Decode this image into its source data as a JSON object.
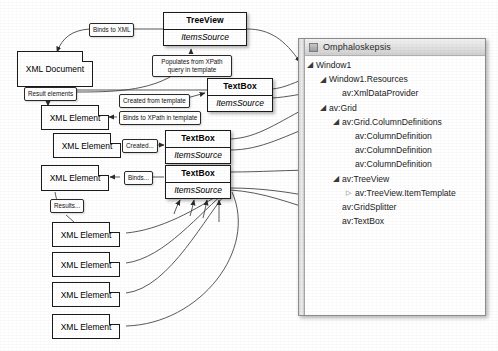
{
  "diagram": {
    "title_nodes": {
      "treeview": {
        "title": "TreeView",
        "prop": "ItemsSource"
      },
      "textbox1": {
        "title": "TextBox",
        "prop": "ItemsSource"
      },
      "textbox2": {
        "title": "TextBox",
        "prop": "ItemsSource"
      },
      "textbox3": {
        "title": "TextBox",
        "prop": "ItemsSource"
      }
    },
    "doc_nodes": {
      "xml_document": "XML Document",
      "xml_element_1": "XML Element",
      "xml_element_2": "XML Element",
      "xml_element_3": "XML Element",
      "xml_element_4": "XML Element",
      "xml_element_5": "XML Element",
      "xml_element_6": "XML Element",
      "xml_element_7": "XML Element"
    },
    "annotations": {
      "binds_to_xml": "Binds to XML",
      "populates_from_xpath": "Populates from XPath query in template",
      "result_elements": "Result elements",
      "created_from_template": "Created from template",
      "binds_to_xpath": "Binds to XPath in template",
      "created_short": "Created...",
      "binds_short": "Binds...",
      "results_short": "Results..."
    }
  },
  "panel": {
    "icon": "window-icon",
    "title": "Omphaloskepsis",
    "tree": [
      {
        "label": "Window1",
        "indent": 0,
        "toggle": "expanded"
      },
      {
        "label": "Window1.Resources",
        "indent": 1,
        "toggle": "expanded"
      },
      {
        "label": "av:XmlDataProvider",
        "indent": 2,
        "toggle": "none"
      },
      {
        "label": "av:Grid",
        "indent": 1,
        "toggle": "expanded"
      },
      {
        "label": "av:Grid.ColumnDefinitions",
        "indent": 2,
        "toggle": "expanded"
      },
      {
        "label": "av:ColumnDefinition",
        "indent": 3,
        "toggle": "none"
      },
      {
        "label": "av:ColumnDefinition",
        "indent": 3,
        "toggle": "none"
      },
      {
        "label": "av:ColumnDefinition",
        "indent": 3,
        "toggle": "none"
      },
      {
        "label": "av:TreeView",
        "indent": 2,
        "toggle": "expanded"
      },
      {
        "label": "av:TreeView.ItemTemplate",
        "indent": 3,
        "toggle": "collapsed"
      },
      {
        "label": "av:GridSplitter",
        "indent": 2,
        "toggle": "none"
      },
      {
        "label": "av:TextBox",
        "indent": 2,
        "toggle": "none"
      }
    ]
  },
  "colors": {
    "node_border": "#1b1b1b",
    "panel_border": "#8d8d8d",
    "wire": "#3c3c3c"
  }
}
